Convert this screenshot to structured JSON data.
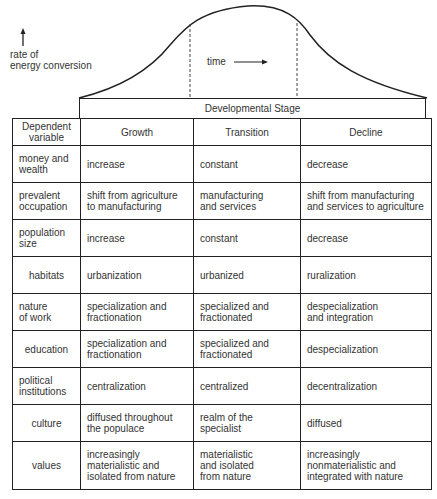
{
  "figure": {
    "y_axis_label": [
      "rate of",
      "energy conversion"
    ],
    "time_label": "time",
    "stage_header": "Developmental Stage",
    "curve": {
      "type": "bell-curve",
      "description": "rate of energy conversion over time",
      "phases": [
        "Growth",
        "Transition",
        "Decline"
      ]
    }
  },
  "table": {
    "header": [
      "Dependent variable",
      "Growth",
      "Transition",
      "Decline"
    ],
    "rows": [
      {
        "variable": [
          "money and",
          "wealth"
        ],
        "growth": [
          "increase"
        ],
        "transition": [
          "constant"
        ],
        "decline": [
          "decrease"
        ]
      },
      {
        "variable": [
          "prevalent",
          "occupation"
        ],
        "growth": [
          "shift from agriculture",
          "to manufacturing"
        ],
        "transition": [
          "manufacturing",
          "and services"
        ],
        "decline": [
          "shift from manufacturing",
          "and services to agriculture"
        ]
      },
      {
        "variable": [
          "population",
          "size"
        ],
        "growth": [
          "increase"
        ],
        "transition": [
          "constant"
        ],
        "decline": [
          "decrease"
        ]
      },
      {
        "variable": [
          "habitats"
        ],
        "growth": [
          "urbanization"
        ],
        "transition": [
          "urbanized"
        ],
        "decline": [
          "ruralization"
        ]
      },
      {
        "variable": [
          "nature",
          "of work"
        ],
        "growth": [
          "specialization and",
          "fractionation"
        ],
        "transition": [
          "specialized and",
          "fractionated"
        ],
        "decline": [
          "despecialization",
          "and integration"
        ]
      },
      {
        "variable": [
          "education"
        ],
        "growth": [
          "specialization and",
          "fractionation"
        ],
        "transition": [
          "specialized and",
          "fractionated"
        ],
        "decline": [
          "despecialization"
        ]
      },
      {
        "variable": [
          "political",
          "institutions"
        ],
        "growth": [
          "centralization"
        ],
        "transition": [
          "centralized"
        ],
        "decline": [
          "decentralization"
        ]
      },
      {
        "variable": [
          "culture"
        ],
        "growth": [
          "diffused throughout",
          "the populace"
        ],
        "transition": [
          "realm of the",
          "specialist"
        ],
        "decline": [
          "diffused"
        ]
      },
      {
        "variable": [
          "values"
        ],
        "growth": [
          "increasingly",
          "materialistic and",
          "isolated from nature"
        ],
        "transition": [
          "materialistic",
          "and isolated",
          "from nature"
        ],
        "decline": [
          "increasingly",
          "nonmaterialistic and",
          "integrated with nature"
        ]
      }
    ]
  }
}
